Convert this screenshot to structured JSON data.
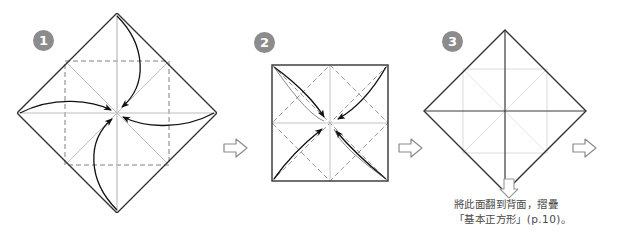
{
  "page": {
    "background_color": "#ffffff",
    "width": 627,
    "height": 245
  },
  "style": {
    "badge_fill": "#8c8c8c",
    "badge_text_color": "#ffffff",
    "paper_edge_color": "#333333",
    "valley_crease_color": "#7a7a7a",
    "mountain_crease_color": "#b5b5b5",
    "arrow_color": "#1a1a1a",
    "flow_arrow_outline": "#808080",
    "caption_color": "#4a4a4a"
  },
  "steps": [
    {
      "id": "step-1",
      "number": "1",
      "shape": "diamond",
      "description": "Square paper rotated 45 degrees with four corners folded to the center",
      "creases": [
        "horizontal-diagonal",
        "vertical-diagonal",
        "inner-square-dashed",
        "inner-diagonals"
      ],
      "fold_arrows": 4,
      "fold_arrow_directions": [
        "top-to-center",
        "left-to-center",
        "right-to-center",
        "bottom-to-center"
      ]
    },
    {
      "id": "step-2",
      "number": "2",
      "shape": "square",
      "description": "Resulting smaller square with four corners folded to the center",
      "creases": [
        "horizontal-midline",
        "vertical-midline",
        "diagonals-dashed",
        "inner-diamond-dashed"
      ],
      "fold_arrows": 4,
      "fold_arrow_directions": [
        "top-left-to-center",
        "top-right-to-center",
        "bottom-left-to-center",
        "bottom-right-to-center"
      ]
    },
    {
      "id": "step-3",
      "number": "3",
      "shape": "diamond",
      "description": "Resulting diamond with centre creases marked",
      "creases": [
        "horizontal-diagonal",
        "vertical-diagonal",
        "inner-square-faint"
      ],
      "fold_arrows": 0,
      "fold_arrow_directions": []
    }
  ],
  "flow_arrows": [
    {
      "id": "flow-1-2",
      "direction": "right",
      "between": "step-1-to-step-2"
    },
    {
      "id": "flow-2-3",
      "direction": "right",
      "between": "step-2-to-step-3"
    },
    {
      "id": "flow-3-next",
      "direction": "right",
      "between": "step-3-to-next"
    },
    {
      "id": "flow-down",
      "direction": "down",
      "between": "step-3-to-caption"
    }
  ],
  "caption": {
    "line1": "將此面翻到背面，摺疊",
    "line2": "「基本正方形」(p.10)。"
  }
}
